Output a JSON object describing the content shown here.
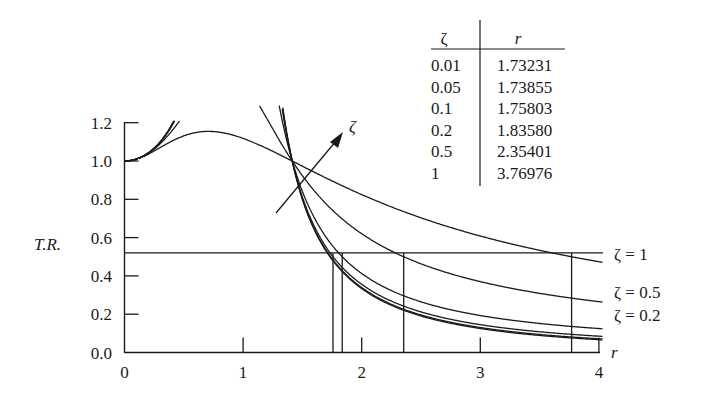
{
  "chart_data": {
    "type": "line",
    "title": "",
    "xlabel": "r",
    "ylabel": "T.R.",
    "xlim": [
      0,
      4
    ],
    "ylim": [
      0,
      1.2
    ],
    "x_ticks": [
      "0",
      "1",
      "2",
      "3",
      "4"
    ],
    "y_ticks": [
      "0.0",
      "0.2",
      "0.4",
      "0.6",
      "0.8",
      "1.0",
      "1.2"
    ],
    "grid": false,
    "legend_position": "inline-right",
    "formula": "T.R. = sqrt((1 + (2ζr)^2) / ((1 - r^2)^2 + (2ζr)^2))",
    "series": [
      {
        "name": "ζ = 0.01",
        "zeta": 0.01,
        "label": ""
      },
      {
        "name": "ζ = 0.05",
        "zeta": 0.05,
        "label": ""
      },
      {
        "name": "ζ = 0.1",
        "zeta": 0.1,
        "label": ""
      },
      {
        "name": "ζ = 0.2",
        "zeta": 0.2,
        "label": "ζ = 0.2"
      },
      {
        "name": "ζ = 0.5",
        "zeta": 0.5,
        "label": "ζ = 0.5"
      },
      {
        "name": "ζ = 1",
        "zeta": 1,
        "label": "ζ = 1"
      }
    ],
    "sample_points": {
      "r": [
        0,
        0.5,
        1.0,
        1.414,
        2,
        3,
        4
      ],
      "zeta_1": [
        1.0,
        1.117,
        1.118,
        1.0,
        0.82,
        0.64,
        0.52
      ],
      "zeta_0.5": [
        1.0,
        1.286,
        1.414,
        1.0,
        0.63,
        0.39,
        0.31
      ],
      "zeta_0.2": [
        1.0,
        1.325,
        2.693,
        1.0,
        0.44,
        0.21,
        0.17
      ]
    },
    "reference_line": {
      "y": 0.52,
      "label": ""
    },
    "annotations": [
      {
        "type": "arrow",
        "label": "ζ",
        "meaning": "increasing damping ratio"
      },
      {
        "type": "crossing_point",
        "r": 1.414,
        "y": 1.0
      }
    ],
    "drop_lines_r": [
      1.73231,
      1.73855,
      1.75803,
      1.8358,
      2.35401,
      3.76976
    ]
  },
  "table": {
    "headers": [
      "ζ",
      "r"
    ],
    "rows": [
      [
        "0.01",
        "1.73231"
      ],
      [
        "0.05",
        "1.73855"
      ],
      [
        "0.1",
        "1.75803"
      ],
      [
        "0.2",
        "1.83580"
      ],
      [
        "0.5",
        "2.35401"
      ],
      [
        "1",
        "3.76976"
      ]
    ]
  },
  "labels": {
    "x_axis": "r",
    "y_axis": "T.R.",
    "arrow": "ζ"
  }
}
